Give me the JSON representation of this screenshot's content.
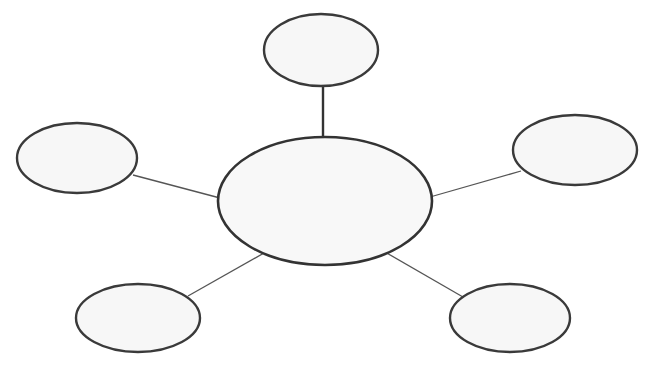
{
  "diagram": {
    "type": "mind-map / bubble web",
    "colors": {
      "background": "#ffffff",
      "node_fill": "#f7f7f7",
      "node_stroke": "#3a3a3a",
      "edge": "#555555"
    },
    "center": {
      "label": "",
      "cx": 325,
      "cy": 201,
      "rx": 107,
      "ry": 64
    },
    "satellites": [
      {
        "id": "top",
        "label": "",
        "cx": 321,
        "cy": 50,
        "rx": 57,
        "ry": 36,
        "edge": {
          "x1": 323,
          "y1": 86,
          "x2": 323,
          "y2": 138,
          "thick": true
        }
      },
      {
        "id": "left",
        "label": "",
        "cx": 77,
        "cy": 158,
        "rx": 60,
        "ry": 35,
        "edge": {
          "x1": 133,
          "y1": 175,
          "x2": 220,
          "y2": 198,
          "thick": false
        }
      },
      {
        "id": "right",
        "label": "",
        "cx": 575,
        "cy": 150,
        "rx": 62,
        "ry": 35,
        "edge": {
          "x1": 521,
          "y1": 171,
          "x2": 430,
          "y2": 197,
          "thick": false
        }
      },
      {
        "id": "bottom-left",
        "label": "",
        "cx": 138,
        "cy": 318,
        "rx": 62,
        "ry": 34,
        "edge": {
          "x1": 188,
          "y1": 296,
          "x2": 264,
          "y2": 253,
          "thick": false
        }
      },
      {
        "id": "bottom-right",
        "label": "",
        "cx": 510,
        "cy": 318,
        "rx": 60,
        "ry": 34,
        "edge": {
          "x1": 463,
          "y1": 297,
          "x2": 385,
          "y2": 252,
          "thick": false
        }
      }
    ]
  }
}
